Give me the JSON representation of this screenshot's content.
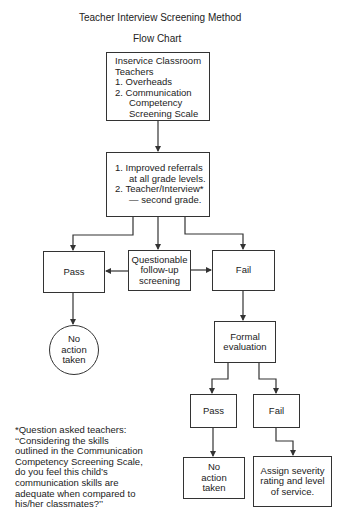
{
  "header": {
    "title": "Teacher Interview Screening Method",
    "subtitle": "Flow Chart"
  },
  "nodes": {
    "inservice": {
      "lines": [
        "Inservice Classroom",
        "Teachers",
        "1. Overheads",
        "2. Communication",
        "Competency",
        "Screening Scale"
      ]
    },
    "referrals": {
      "lines": [
        "1. Improved referrals",
        "at all grade levels.",
        "2. Teacher/Interview*",
        "— second grade."
      ]
    },
    "pass": {
      "label": "Pass"
    },
    "questionable": {
      "lines": [
        "Questionable",
        "follow-up",
        "screening"
      ]
    },
    "fail": {
      "label": "Fail"
    },
    "no_action_circle": {
      "lines": [
        "No",
        "action",
        "taken"
      ]
    },
    "formal_evaluation": {
      "lines": [
        "Formal",
        "evaluation"
      ]
    },
    "eval_pass": {
      "label": "Pass"
    },
    "eval_fail": {
      "label": "Fail"
    },
    "eval_no_action": {
      "lines": [
        "No",
        "action",
        "taken"
      ]
    },
    "assign_severity": {
      "lines": [
        "Assign severity",
        "rating and level",
        "of service."
      ]
    }
  },
  "footnote": {
    "lines": [
      "*Question asked teachers:",
      "‘‘Considering the skills",
      "outlined in the Communication",
      "Competency Screening Scale,",
      "do you feel this child’s",
      "communication skills are",
      "adequate when compared to",
      "his/her classmates?’’"
    ]
  },
  "colors": {
    "stroke": "#333333",
    "text": "#222222",
    "background": "#ffffff"
  }
}
